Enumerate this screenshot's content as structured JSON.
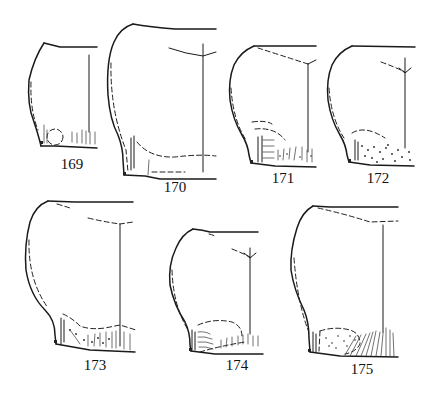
{
  "plate": {
    "description": "Scientific line-drawing plate of specimen outlines (lateral view), numbered figures",
    "figures": [
      {
        "number": "169",
        "label_pos": [
          72,
          162
        ]
      },
      {
        "number": "170",
        "label_pos": [
          175,
          185
        ]
      },
      {
        "number": "171",
        "label_pos": [
          283,
          176
        ]
      },
      {
        "number": "172",
        "label_pos": [
          378,
          176
        ]
      },
      {
        "number": "173",
        "label_pos": [
          95,
          364
        ]
      },
      {
        "number": "174",
        "label_pos": [
          237,
          364
        ]
      },
      {
        "number": "175",
        "label_pos": [
          362,
          368
        ]
      }
    ]
  }
}
